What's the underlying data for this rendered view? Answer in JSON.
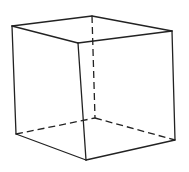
{
  "figure": {
    "stroke_color": "#222222",
    "background": "#ffffff"
  },
  "vertices": {
    "A": [
      12,
      26
    ],
    "B": [
      92,
      16
    ],
    "C": [
      172,
      31
    ],
    "D": [
      78,
      43
    ],
    "E": [
      16,
      134
    ],
    "F": [
      95,
      118
    ],
    "G": [
      175,
      140
    ],
    "H": [
      86,
      160
    ]
  },
  "edges": [
    {
      "from": "A",
      "to": "B",
      "style": "solid"
    },
    {
      "from": "B",
      "to": "C",
      "style": "solid"
    },
    {
      "from": "C",
      "to": "D",
      "style": "solid"
    },
    {
      "from": "D",
      "to": "A",
      "style": "solid"
    },
    {
      "from": "A",
      "to": "E",
      "style": "solid"
    },
    {
      "from": "D",
      "to": "H",
      "style": "solid"
    },
    {
      "from": "C",
      "to": "G",
      "style": "solid"
    },
    {
      "from": "E",
      "to": "H",
      "style": "solid"
    },
    {
      "from": "H",
      "to": "G",
      "style": "solid"
    },
    {
      "from": "B",
      "to": "F",
      "style": "dashed"
    },
    {
      "from": "E",
      "to": "F",
      "style": "dashed"
    },
    {
      "from": "F",
      "to": "G",
      "style": "dashed"
    }
  ]
}
